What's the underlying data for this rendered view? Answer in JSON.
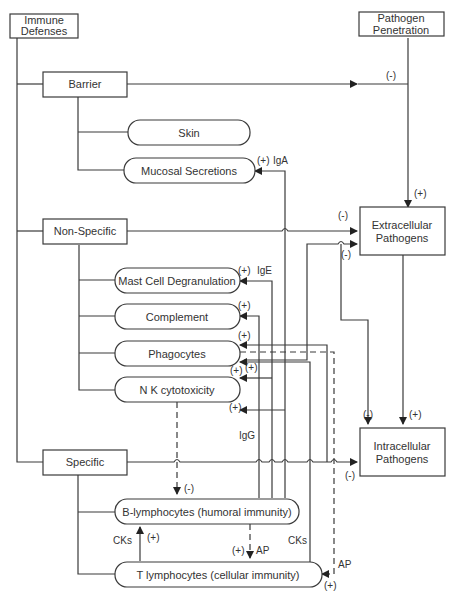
{
  "nodes": {
    "immune_defenses": {
      "line1": "Immune",
      "line2": "Defenses"
    },
    "pathogen_penetration": {
      "line1": "Pathogen",
      "line2": "Penetration"
    },
    "barrier": "Barrier",
    "skin": "Skin",
    "mucosal": "Mucosal Secretions",
    "non_specific": "Non-Specific",
    "mast_cell": "Mast Cell Degranulation",
    "complement": "Complement",
    "phagocytes": "Phagocytes",
    "nk": "N K cytotoxicity",
    "specific": "Specific",
    "b_lymph": "B-lymphocytes (humoral immunity)",
    "t_lymph": "T lymphocytes (cellular immunity)",
    "extracellular": {
      "line1": "Extracellular",
      "line2": "Pathogens"
    },
    "intracellular": {
      "line1": "Intracellular",
      "line2": "Pathogens"
    }
  },
  "edge_labels": {
    "barrier_to_pen": "(-)",
    "pen_to_extra": "(+)",
    "iga_sign": "(+)",
    "iga": "IgA",
    "nonspec_to_extra": "(-)",
    "phago_to_extra": "(-)",
    "ige_sign": "(+)",
    "ige": "IgE",
    "complement_sign": "(+)",
    "phago_sign": "(+)",
    "nk_sign1": "(+)",
    "nk_sign2": "(+)",
    "nk_sign3": "(+)",
    "igg": "IgG",
    "extra_to_intra_neg": "(-)",
    "extra_to_intra_pos": "(+)",
    "spec_to_intra": "(-)",
    "nk_to_b": "(-)",
    "cks_left": "CKs",
    "cks_left_sign": "(+)",
    "b_to_t_sign": "(+)",
    "b_to_t_ap": "AP",
    "cks_right": "CKs",
    "t_ap": "AP",
    "t_ap_sign": "(+)"
  }
}
